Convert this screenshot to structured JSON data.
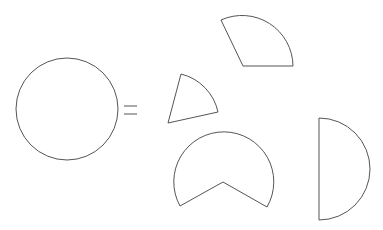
{
  "diagram": {
    "stroke_color": "#555555",
    "background": "#ffffff",
    "whole_circle": {
      "cx": 67,
      "cy": 109,
      "r": 51
    },
    "equals_sign": {
      "x1": 124,
      "x2": 137,
      "y_top": 106,
      "y_bottom": 114
    },
    "pieces": [
      {
        "name": "quarter-sector-top",
        "path": "M243 66 L221 20 A51 51 0 0 1 293 66 Z"
      },
      {
        "name": "small-sector",
        "path": "M168 123 L181 74 A50 50 0 0 1 218 112 Z"
      },
      {
        "name": "pacman-sector",
        "path": "M223 182 L180 206 A50 50 0 1 1 267 207 Z"
      },
      {
        "name": "semicircle",
        "path": "M319 118 A51 51 0 0 1 319 220 Z"
      }
    ]
  }
}
